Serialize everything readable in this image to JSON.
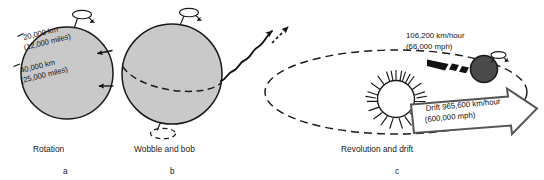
{
  "figure": {
    "background_color": "#ffffff",
    "sphere_fill": "#c9c9c9",
    "sphere_stroke": "#1a1a1a",
    "planet_fill": "#4a4a4a",
    "line_color": "#1a1a1a",
    "drift_arrow_stroke": "#555555"
  },
  "panels": [
    {
      "id": "a",
      "caption": "Rotation",
      "letter": "a",
      "labels": [
        {
          "line1": "20,000 km",
          "line2": "(12,000 miles)"
        },
        {
          "line1": "40,000 km",
          "line2": "(25,000 miles)"
        }
      ]
    },
    {
      "id": "b",
      "caption": "Wobble and bob",
      "letter": "b",
      "labels": []
    },
    {
      "id": "c",
      "caption": "Revolution and drift",
      "letter": "c",
      "labels": [],
      "orbit_speed": {
        "line1": "106,200 km/hour",
        "line2": "(66,000 mph)"
      },
      "drift_speed": {
        "line1": "Drift 965,600 km/hour",
        "line2": "(600,000 mph)"
      }
    }
  ]
}
